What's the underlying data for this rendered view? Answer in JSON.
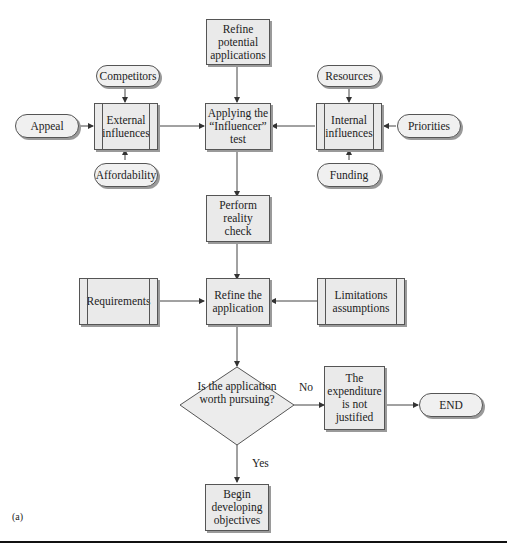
{
  "nodes": {
    "refine_potential": "Refine potential applications",
    "competitors": "Competitors",
    "resources": "Resources",
    "appeal": "Appeal",
    "external": "External influences",
    "applying": "Applying the “Influencer” test",
    "internal": "Internal influences",
    "priorities": "Priorities",
    "affordability": "Affordability",
    "funding": "Funding",
    "reality": "Perform reality check",
    "requirements": "Requirements",
    "refine_app": "Refine the application",
    "limitations": "Limitations assumptions",
    "decision": "Is the application worth pursuing?",
    "expenditure": "The expenditure is not justified",
    "end": "END",
    "begin": "Begin developing objectives"
  },
  "edge_labels": {
    "no": "No",
    "yes": "Yes"
  },
  "caption": "(a)"
}
